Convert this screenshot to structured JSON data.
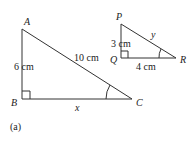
{
  "figure": {
    "caption": "(a)",
    "triangle_abc": {
      "vertices": {
        "A": "A",
        "B": "B",
        "C": "C"
      },
      "side_ab": "6 cm",
      "side_ac": "10 cm",
      "side_bc": "x",
      "right_angle_at": "B",
      "marked_angle_at": "C"
    },
    "triangle_pqr": {
      "vertices": {
        "P": "P",
        "Q": "Q",
        "R": "R"
      },
      "side_pq": "3 cm",
      "side_qr": "4 cm",
      "side_pr": "y",
      "right_angle_at": "Q",
      "marked_angle_at": "R"
    },
    "line_color": "#333333"
  }
}
